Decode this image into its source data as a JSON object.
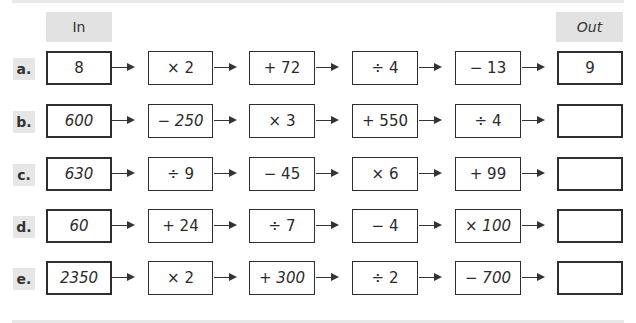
{
  "headers": {
    "in": "In",
    "out": "Out"
  },
  "rows": [
    {
      "label": "a.",
      "input": "8",
      "steps": [
        "× 2",
        "+ 72",
        "÷ 4",
        "− 13"
      ],
      "output": "9"
    },
    {
      "label": "b.",
      "input": "600",
      "steps": [
        "− 250",
        "× 3",
        "+ 550",
        "÷ 4"
      ],
      "output": ""
    },
    {
      "label": "c.",
      "input": "630",
      "steps": [
        "÷ 9",
        "− 45",
        "× 6",
        "+ 99"
      ],
      "output": ""
    },
    {
      "label": "d.",
      "input": "60",
      "steps": [
        "+ 24",
        "÷ 7",
        "− 4",
        "× 100"
      ],
      "output": ""
    },
    {
      "label": "e.",
      "input": "2350",
      "steps": [
        "× 2",
        "+ 300",
        "÷ 2",
        "− 700"
      ],
      "output": ""
    }
  ],
  "icons": {
    "arrow": "right-arrow-icon"
  }
}
